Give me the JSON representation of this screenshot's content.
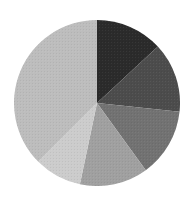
{
  "chart_data": {
    "type": "pie",
    "title": "",
    "categories": [
      "Slice 1",
      "Slice 2",
      "Slice 3",
      "Slice 4",
      "Slice 5",
      "Slice 6"
    ],
    "values": [
      13.1,
      13.6,
      13.3,
      13.3,
      9.2,
      37.5
    ],
    "units": "percent (estimated from slice angles)",
    "start_angle_deg": 0,
    "direction": "clockwise",
    "colors": [
      "#2b2b2b",
      "#4c4c4c",
      "#727272",
      "#a0a0a0",
      "#cccccc",
      "#bdbdbd"
    ],
    "legend": null,
    "labels_shown": false,
    "center": [
      97,
      103
    ],
    "radius": 83
  }
}
